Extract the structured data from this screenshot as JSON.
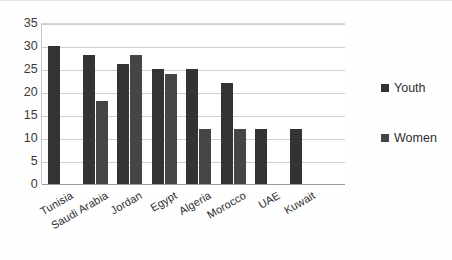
{
  "chart_data": {
    "type": "bar",
    "title": "",
    "subtitle": "",
    "xlabel": "",
    "ylabel": "",
    "categories": [
      "Tunisia",
      "Saudi Arabia",
      "Jordan",
      "Egypt",
      "Algeria",
      "Morocco",
      "UAE",
      "Kuwait"
    ],
    "series": [
      {
        "name": "Youth",
        "color": "#333333",
        "values": [
          30,
          28,
          26,
          25,
          25,
          22,
          12,
          12
        ]
      },
      {
        "name": "Women",
        "color": "#454545",
        "values": [
          null,
          18,
          28,
          24,
          12,
          12,
          null,
          null
        ]
      }
    ],
    "ylim": [
      0,
      35
    ],
    "ytick_step": 5,
    "yticks": [
      35,
      30,
      25,
      20,
      15,
      10,
      5,
      0
    ],
    "grid": true,
    "grid_axis": "y",
    "legend_position": "right",
    "legend_entries": [
      "Youth",
      "Women"
    ],
    "xtick_rotation": -30,
    "annotations": []
  },
  "colors": {
    "youth": "#333333",
    "women": "#454545",
    "gridline": "#cfcfcf",
    "axis": "#9a9a9a",
    "text": "#2e2e2e",
    "background": "#ffffff"
  }
}
